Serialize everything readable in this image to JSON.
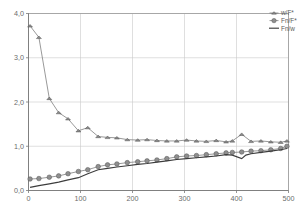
{
  "chart_data": {
    "type": "line",
    "title": "",
    "subtitle": "",
    "xlabel": "",
    "ylabel": "",
    "xlim": [
      0,
      500
    ],
    "ylim": [
      0,
      4.0
    ],
    "grid": true,
    "legend_position": "top-right",
    "x_ticks": [
      "0",
      "100",
      "200",
      "300",
      "400",
      "500"
    ],
    "x_tick_values": [
      0,
      100,
      200,
      300,
      400,
      500
    ],
    "y_ticks": [
      "0,0",
      "1,0",
      "2,0",
      "3,0",
      "4,0"
    ],
    "y_tick_values": [
      0,
      1,
      2,
      3,
      4
    ],
    "series": [
      {
        "name": "w/F*",
        "marker": "triangle",
        "color": "#8a8a8a",
        "x": [
          3,
          20,
          40,
          58,
          76,
          96,
          114,
          134,
          152,
          170,
          190,
          210,
          228,
          247,
          266,
          285,
          304,
          323,
          342,
          361,
          380,
          392,
          410,
          428,
          447,
          466,
          485,
          497
        ],
        "values": [
          3.72,
          3.46,
          2.08,
          1.76,
          1.62,
          1.35,
          1.42,
          1.22,
          1.2,
          1.19,
          1.15,
          1.14,
          1.15,
          1.13,
          1.12,
          1.12,
          1.14,
          1.12,
          1.11,
          1.13,
          1.1,
          1.12,
          1.27,
          1.11,
          1.12,
          1.1,
          1.09,
          1.12
        ]
      },
      {
        "name": "Fn/F*",
        "marker": "circle",
        "color": "#8f8f8f",
        "x": [
          3,
          20,
          40,
          58,
          76,
          96,
          114,
          134,
          152,
          170,
          190,
          210,
          228,
          247,
          266,
          285,
          304,
          323,
          342,
          361,
          380,
          392,
          410,
          428,
          447,
          466,
          485,
          497
        ],
        "values": [
          0.26,
          0.27,
          0.3,
          0.33,
          0.38,
          0.43,
          0.47,
          0.54,
          0.58,
          0.6,
          0.63,
          0.65,
          0.67,
          0.69,
          0.72,
          0.76,
          0.78,
          0.79,
          0.81,
          0.83,
          0.85,
          0.86,
          0.87,
          0.89,
          0.9,
          0.92,
          0.95,
          1.0
        ]
      },
      {
        "name": "Fn/w",
        "marker": "none",
        "color": "#3d3d3d",
        "x": [
          3,
          20,
          40,
          58,
          76,
          96,
          114,
          134,
          152,
          170,
          190,
          210,
          228,
          247,
          266,
          285,
          304,
          323,
          342,
          361,
          380,
          392,
          410,
          418,
          428,
          447,
          466,
          485,
          497
        ],
        "values": [
          0.07,
          0.11,
          0.15,
          0.19,
          0.24,
          0.29,
          0.38,
          0.47,
          0.5,
          0.53,
          0.56,
          0.59,
          0.61,
          0.64,
          0.67,
          0.7,
          0.72,
          0.74,
          0.76,
          0.78,
          0.81,
          0.8,
          0.72,
          0.8,
          0.83,
          0.86,
          0.89,
          0.92,
          0.95
        ]
      }
    ]
  },
  "legend": {
    "items": [
      {
        "label": "w/F*",
        "marker": "triangle"
      },
      {
        "label": "Fn/F*",
        "marker": "circle"
      },
      {
        "label": "Fn/w",
        "marker": "line"
      }
    ]
  },
  "colors": {
    "background": "#ffffff",
    "grid": "#c9c9c9",
    "frame": "#9a9a9a",
    "axis": "#7a7a7a",
    "text": "#6b6b6b",
    "series_marker": "#8a8a8a",
    "series_solid": "#3d3d3d"
  }
}
